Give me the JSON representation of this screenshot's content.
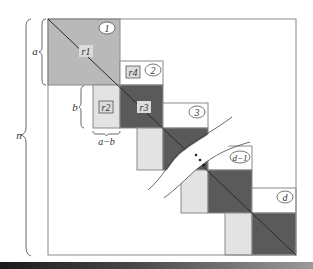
{
  "diagram": {
    "colors": {
      "frame": "#8a8a8a",
      "block_1": "#b9b9b9",
      "dark": "#5a5a5a",
      "light": "#e3e3e3",
      "white": "#ffffff",
      "tag_box": "#dcdcdc"
    },
    "dimension_labels": {
      "n": "n",
      "a": "a",
      "b": "b",
      "a_minus_b": "a−b"
    },
    "region_labels": {
      "r1": "r1",
      "r2": "r2",
      "r3": "r3",
      "r4": "r4"
    },
    "block_numbers": [
      "1",
      "2",
      "3",
      "d−1",
      "d"
    ],
    "ellipsis": "⋯"
  }
}
